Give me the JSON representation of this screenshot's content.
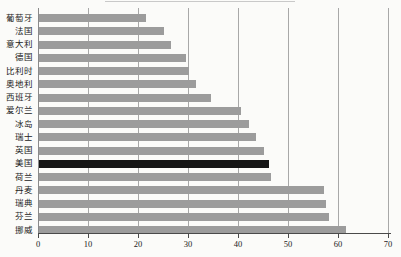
{
  "figure": {
    "background": "#fbfbf9",
    "cropped_line_color": "#c9c9c9"
  },
  "chart_data": {
    "type": "bar",
    "orientation": "horizontal",
    "title": "",
    "xlabel": "",
    "ylabel": "",
    "legend": "none",
    "grid": "vertical gridlines at every x tick",
    "categories": [
      "葡萄牙",
      "法国",
      "意大利",
      "德国",
      "比利时",
      "奥地利",
      "西班牙",
      "爱尔兰",
      "冰岛",
      "瑞士",
      "英国",
      "美国",
      "荷兰",
      "丹麦",
      "瑞典",
      "芬兰",
      "挪威"
    ],
    "values": [
      21.5,
      25,
      26.5,
      29.5,
      30,
      31.5,
      34.5,
      40.5,
      42,
      43.5,
      45,
      46,
      46.5,
      57,
      57.5,
      58,
      61.5
    ],
    "highlight_category": "美国",
    "xlim": [
      0,
      70
    ],
    "x_ticks": [
      "0",
      "10",
      "20",
      "30",
      "40",
      "50",
      "60",
      "70"
    ],
    "colors": {
      "bar": "#9c9c9c",
      "highlight_bar": "#161616",
      "gridline": "#a8a8a8",
      "zero_line": "#8a8a8a",
      "axis": "#4a4a4a",
      "text": "#222222"
    }
  }
}
